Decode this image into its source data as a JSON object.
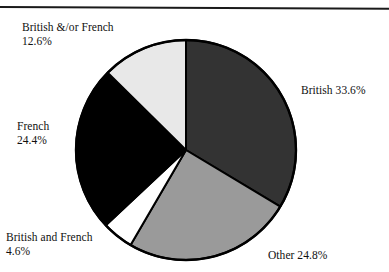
{
  "figure": {
    "has_top_rule": true,
    "background_color": "#ffffff",
    "text_color": "#101010"
  },
  "chart_data": {
    "type": "pie",
    "title": "",
    "subtitle": "",
    "xlabel": "",
    "ylabel": "",
    "legend_position": "none",
    "grid": false,
    "start_angle_deg": 0,
    "direction": "clockwise",
    "center": {
      "x": 186,
      "y": 150
    },
    "radius": 110,
    "total_percent": 100.0,
    "categories": [
      "British",
      "Other",
      "British and French",
      "French",
      "British &/or French"
    ],
    "values": [
      33.6,
      24.8,
      4.6,
      24.4,
      12.6
    ],
    "slices": [
      {
        "label": "British",
        "value": 33.6,
        "value_text": "33.6%",
        "color": "#333333",
        "start_deg": 0.0,
        "end_deg": 120.96
      },
      {
        "label": "Other",
        "value": 24.8,
        "value_text": "24.8%",
        "color": "#9a9a9a",
        "start_deg": 120.96,
        "end_deg": 210.24
      },
      {
        "label": "British and French",
        "value": 4.6,
        "value_text": "4.6%",
        "color": "#ffffff",
        "start_deg": 210.24,
        "end_deg": 226.8
      },
      {
        "label": "French",
        "value": 24.4,
        "value_text": "24.4%",
        "color": "#000000",
        "start_deg": 226.8,
        "end_deg": 314.64
      },
      {
        "label": "British &/or French",
        "value": 12.6,
        "value_text": "12.6%",
        "color": "#e8e8e8",
        "start_deg": 314.64,
        "end_deg": 360.0
      }
    ],
    "outline_color": "#000000",
    "outline_width": 2
  },
  "labels": {
    "british_or_french": {
      "line1": "British &/or French",
      "line2": "12.6%"
    },
    "french": {
      "line1": "French",
      "line2": "24.4%"
    },
    "british_and_french": {
      "line1": "British and French",
      "line2": "4.6%"
    },
    "british": {
      "text": "British 33.6%"
    },
    "other": {
      "text": "Other 24.8%"
    }
  }
}
